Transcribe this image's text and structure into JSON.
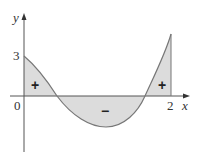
{
  "figure": {
    "axes": {
      "x_label": "x",
      "y_label": "y",
      "x_ticks": [
        "0",
        "2"
      ],
      "y_ticks": [
        "3"
      ]
    },
    "regions": [
      {
        "name": "left-positive",
        "sign": "+"
      },
      {
        "name": "middle-negative",
        "sign": "−"
      },
      {
        "name": "right-positive",
        "sign": "+"
      }
    ],
    "colors": {
      "fill": "#dcdcdc",
      "curve": "#777777",
      "axis": "#555555"
    }
  }
}
